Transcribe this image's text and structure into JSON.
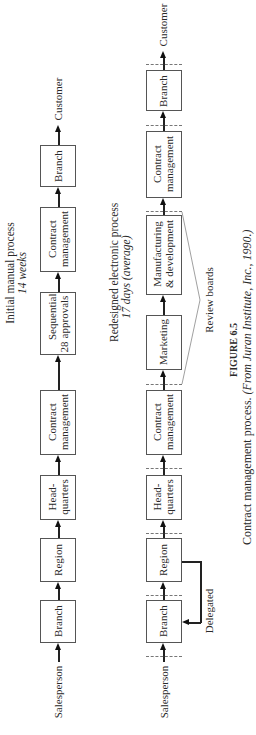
{
  "figure": {
    "number": "FIGURE 6.5",
    "caption": "Contract management process.",
    "source": "(From Juran Institute, Inc., 1990.)"
  },
  "manual_process": {
    "title": "Initial manual process",
    "duration": "14 weeks",
    "start": "Salesperson",
    "end": "Customer",
    "steps": [
      {
        "label": "Branch"
      },
      {
        "label": "Region"
      },
      {
        "label": "Head-\nquarters",
        "l1": "Head-",
        "l2": "quarters"
      },
      {
        "label": "Contract management",
        "l1": "Contract",
        "l2": "management"
      },
      {
        "label": "Sequential approvals",
        "l1": "Sequential",
        "l2": "approvals",
        "count": "28"
      },
      {
        "label": "Contract management",
        "l1": "Contract",
        "l2": "management"
      },
      {
        "label": "Branch"
      }
    ]
  },
  "electronic_process": {
    "title": "Redesigned electronic process",
    "duration": "17 days (average)",
    "start": "Salesperson",
    "end": "Customer",
    "delegated_label": "Delegated",
    "review_boards_label": "Review boards",
    "steps": [
      {
        "label": "Branch"
      },
      {
        "label": "Region"
      },
      {
        "label": "Head-quarters",
        "l1": "Head-",
        "l2": "quarters"
      },
      {
        "label": "Contract management",
        "l1": "Contract",
        "l2": "management"
      },
      {
        "label": "Marketing"
      },
      {
        "label": "Manufacturing & development",
        "l1": "Manufacturing",
        "l2": "& development"
      },
      {
        "label": "Contract management",
        "l1": "Contract",
        "l2": "management"
      },
      {
        "label": "Branch"
      }
    ]
  }
}
